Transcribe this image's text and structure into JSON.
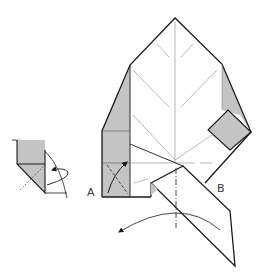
{
  "diagram": {
    "type": "origami-instruction-step",
    "labels": {
      "point_a": "A",
      "point_b": "B"
    },
    "colors": {
      "paper_white": "#ffffff",
      "paper_gray": "#c4c4c4",
      "line_dark": "#1a1a1a",
      "line_crease": "#9a9a9a"
    },
    "elements": [
      {
        "name": "main-model",
        "description": "Leaf-shaped folded model with pointed top"
      },
      {
        "name": "inset-detail",
        "description": "Magnified circle-quadrant detail showing fold behind"
      },
      {
        "name": "flap",
        "description": "Long pointed flap swinging out to lower right"
      },
      {
        "name": "swing-arrow",
        "description": "Curved arrow swinging flap to the left"
      },
      {
        "name": "fold-arrow-a",
        "description": "Curved arrow folding corner A up"
      },
      {
        "name": "valley-fold-line",
        "description": "Vertical dash-dot fold line through center"
      }
    ]
  }
}
